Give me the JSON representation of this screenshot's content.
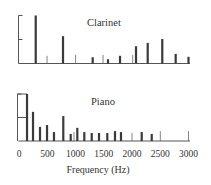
{
  "chart_data": [
    {
      "type": "bar",
      "title": "Clarinet",
      "xlabel": "Frequency (Hz)",
      "ylabel": "",
      "xlim": [
        0,
        3000
      ],
      "ylim": [
        0,
        1
      ],
      "grid": false,
      "legend": null,
      "y_ticks": [
        0,
        0.5,
        1
      ],
      "harmonics": [
        {
          "freq": 296,
          "amp": 1.0,
          "style": "thick"
        },
        {
          "freq": 496,
          "amp": 0.16,
          "style": "thin"
        },
        {
          "freq": 779,
          "amp": 0.57,
          "style": "thick"
        },
        {
          "freq": 1003,
          "amp": 0.18,
          "style": "thin"
        },
        {
          "freq": 1304,
          "amp": 0.13,
          "style": "thick"
        },
        {
          "freq": 1487,
          "amp": 0.18,
          "style": "thin"
        },
        {
          "freq": 1575,
          "amp": 0.09,
          "style": "thick"
        },
        {
          "freq": 1788,
          "amp": 0.16,
          "style": "thick"
        },
        {
          "freq": 2013,
          "amp": 0.18,
          "style": "thin"
        },
        {
          "freq": 2071,
          "amp": 0.36,
          "style": "thick"
        },
        {
          "freq": 2278,
          "amp": 0.43,
          "style": "thick"
        },
        {
          "freq": 2536,
          "amp": 0.51,
          "style": "thick"
        },
        {
          "freq": 2773,
          "amp": 0.2,
          "style": "thick"
        },
        {
          "freq": 3000,
          "amp": 0.14,
          "style": "thick"
        }
      ]
    },
    {
      "type": "bar",
      "title": "Piano",
      "xlabel": "Frequency (Hz)",
      "ylabel": "",
      "xlim": [
        0,
        3000
      ],
      "ylim": [
        0,
        1
      ],
      "grid": false,
      "legend": null,
      "y_ticks": [
        0,
        0.5,
        1
      ],
      "x_ticks": [
        0,
        500,
        1000,
        1500,
        2000,
        2500,
        3000
      ],
      "harmonics": [
        {
          "freq": 142,
          "amp": 1.0,
          "style": "thick"
        },
        {
          "freq": 248,
          "amp": 0.62,
          "style": "thick"
        },
        {
          "freq": 372,
          "amp": 0.3,
          "style": "thick"
        },
        {
          "freq": 496,
          "amp": 0.34,
          "style": "thick"
        },
        {
          "freq": 619,
          "amp": 0.19,
          "style": "thick"
        },
        {
          "freq": 784,
          "amp": 0.53,
          "style": "thick"
        },
        {
          "freq": 915,
          "amp": 0.15,
          "style": "thick"
        },
        {
          "freq": 973,
          "amp": 0.19,
          "style": "thin"
        },
        {
          "freq": 1032,
          "amp": 0.28,
          "style": "thick"
        },
        {
          "freq": 1156,
          "amp": 0.19,
          "style": "thick"
        },
        {
          "freq": 1287,
          "amp": 0.17,
          "style": "thick"
        },
        {
          "freq": 1416,
          "amp": 0.17,
          "style": "thick"
        },
        {
          "freq": 1563,
          "amp": 0.17,
          "style": "thick"
        },
        {
          "freq": 1699,
          "amp": 0.21,
          "style": "thick"
        },
        {
          "freq": 1805,
          "amp": 0.19,
          "style": "thick"
        },
        {
          "freq": 2000,
          "amp": 0.17,
          "style": "thin"
        },
        {
          "freq": 2172,
          "amp": 0.19,
          "style": "thick"
        },
        {
          "freq": 2349,
          "amp": 0.15,
          "style": "thick"
        },
        {
          "freq": 2500,
          "amp": 0.21,
          "style": "thin"
        },
        {
          "freq": 3000,
          "amp": 0.21,
          "style": "thin"
        }
      ]
    }
  ],
  "axis": {
    "x_tick_labels": [
      "0",
      "500",
      "1000",
      "1500",
      "2000",
      "2500",
      "3000"
    ],
    "xlabel": "Frequency (Hz)"
  },
  "colors": {
    "bar": "#3a3a3a",
    "axis": "#555555",
    "text": "#333333"
  }
}
